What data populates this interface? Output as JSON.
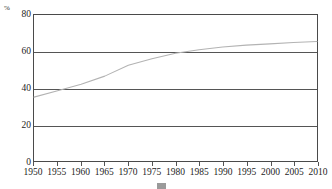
{
  "chart_data": {
    "type": "line",
    "title": "",
    "subtitle": "",
    "xlabel": "",
    "ylabel": "",
    "yunit": "%",
    "grid": true,
    "legend_position": "bottom",
    "xlim": [
      1950,
      2010
    ],
    "ylim": [
      0,
      80
    ],
    "yticks": [
      80,
      60,
      40,
      20,
      0
    ],
    "xticks": [
      1950,
      1955,
      1960,
      1965,
      1970,
      1975,
      1980,
      1985,
      1990,
      1995,
      2000,
      2005,
      2010
    ],
    "x": [
      1950,
      1955,
      1960,
      1965,
      1970,
      1975,
      1980,
      1985,
      1990,
      1995,
      2000,
      2005,
      2010
    ],
    "series": [
      {
        "name": "Urbanization rate",
        "color": "#b3b3b3",
        "values": [
          35.0,
          38.5,
          42.0,
          46.5,
          52.5,
          56.0,
          59.0,
          61.0,
          62.5,
          63.5,
          64.2,
          64.9,
          65.5
        ]
      }
    ],
    "annotations": []
  },
  "axes": {
    "y_unit_label": "%",
    "y_tick_labels": [
      "80",
      "60",
      "40",
      "20",
      "0"
    ],
    "x_tick_labels": [
      "1950",
      "1955",
      "1960",
      "1965",
      "1970",
      "1975",
      "1980",
      "1985",
      "1990",
      "1995",
      "2000",
      "2005",
      "2010"
    ]
  },
  "caption": {
    "text": "",
    "legend_label": ""
  },
  "colors": {
    "line": "#b3b3b3",
    "grid": "#555555",
    "frame": "#4a4a4a",
    "text": "#1d1d1d",
    "background": "#ffffff"
  }
}
